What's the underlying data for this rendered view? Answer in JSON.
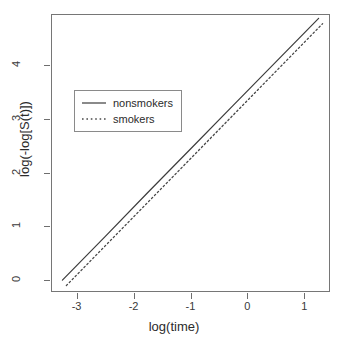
{
  "chart_data": {
    "type": "line",
    "title": "",
    "xlabel": "log(time)",
    "ylabel": "log(-log[S(t)])",
    "xlim": [
      -3.45,
      1.45
    ],
    "ylim": [
      -0.22,
      4.95
    ],
    "xticks": [
      -3,
      -2,
      -1,
      0,
      1
    ],
    "xticklabels": [
      "-3",
      "-2",
      "-1",
      "0",
      "1"
    ],
    "yticks": [
      0,
      1,
      2,
      3,
      4
    ],
    "yticklabels": [
      "0",
      "1",
      "2",
      "3",
      "4"
    ],
    "grid": false,
    "legend_position": "upper-left",
    "series": [
      {
        "name": "nonsmokers",
        "linestyle": "solid",
        "color": "#3c3c3c",
        "x": [
          -3.25,
          -2.5,
          -1.75,
          -1.0,
          -0.25,
          0.5,
          1.25
        ],
        "y": [
          0.0,
          0.81,
          1.63,
          2.44,
          3.25,
          4.06,
          4.87
        ]
      },
      {
        "name": "smokers",
        "linestyle": "dotted",
        "color": "#4a4a4a",
        "x": [
          -3.18,
          -2.45,
          -1.72,
          -0.99,
          -0.26,
          0.47,
          1.32
        ],
        "y": [
          -0.1,
          0.69,
          1.48,
          2.27,
          3.06,
          3.85,
          4.77
        ]
      }
    ]
  },
  "axes": {
    "xlabel": "log(time)",
    "ylabel": "log(-log[S(t)])",
    "xticklabels": [
      "-3",
      "-2",
      "-1",
      "0",
      "1"
    ],
    "yticklabels": [
      "0",
      "1",
      "2",
      "3",
      "4"
    ]
  },
  "legend": {
    "entries": [
      {
        "label": "nonsmokers",
        "linestyle": "solid"
      },
      {
        "label": "smokers",
        "linestyle": "dotted"
      }
    ]
  },
  "colors": {
    "line_nonsmokers": "#3c3c3c",
    "line_smokers": "#4a4a4a",
    "frame": "#767676",
    "background": "#ffffff",
    "text": "#2b2b2b"
  }
}
